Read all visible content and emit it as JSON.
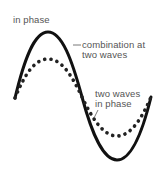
{
  "title": "in phase",
  "labels": {
    "combination_line1": "combination at",
    "combination_line2": "two waves",
    "component_line1": "two waves",
    "component_line2": "in phase"
  },
  "colors": {
    "combined_wave": "#111111",
    "component_wave": "#222222",
    "text": "#555555",
    "leader_line": "#555555"
  },
  "waves": {
    "combined": {
      "style": "solid",
      "amplitude_px": 64,
      "description": "resultant wave, larger amplitude"
    },
    "component": {
      "style": "dotted",
      "amplitude_px": 38,
      "description": "two identical waves in phase, overlapping"
    }
  }
}
